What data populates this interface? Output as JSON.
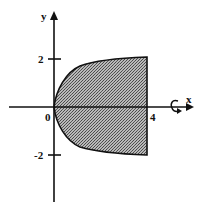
{
  "figure": {
    "axes": {
      "x_label": "x",
      "y_label": "y",
      "origin_label": "0"
    },
    "ticks": {
      "x": [
        {
          "value": 4,
          "label": "4"
        }
      ],
      "y": [
        {
          "value": 2,
          "label": "2"
        },
        {
          "value": -2,
          "label": "-2"
        }
      ]
    },
    "region": {
      "curve": "y^2 = 4x",
      "right_boundary": "x = 4",
      "y_range": [
        -2,
        2
      ],
      "fill": "stippled gray"
    },
    "rotation_axis": "x",
    "colors": {
      "ink": "#111111",
      "fill": "#8a8a8a",
      "background": "#ffffff"
    }
  }
}
